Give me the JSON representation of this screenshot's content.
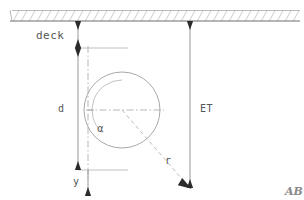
{
  "figure": {
    "background_color": "#ffffff",
    "line_color": "#9a9a9a",
    "dim_line_color": "#8c8c8c",
    "text_color": "#555555",
    "hatch_color": "#8f8f8f"
  },
  "labels": {
    "deck": "deck",
    "d": "d",
    "et": "ET",
    "alpha": "α",
    "r": "r",
    "y": "y",
    "corner": "AB"
  },
  "geometry": {
    "deck_band": {
      "x": 10,
      "y": 10,
      "width": 290,
      "height": 11
    },
    "circle": {
      "cx": 122,
      "cy": 110,
      "r": 38
    },
    "center_vertical_line": {
      "x": 88,
      "y1": 46,
      "y2": 180
    },
    "center_horizontal_line": {
      "x1": 86,
      "x2": 164,
      "y": 110
    },
    "d_dimension": {
      "x": 78,
      "y_top": 48,
      "y_bottom": 170
    },
    "deck_dimension": {
      "x": 78,
      "y_top": 20,
      "y_bottom": 48
    },
    "et_dimension": {
      "x": 190,
      "y_top": 20,
      "y_bottom": 188
    },
    "radius_line": {
      "x1": 122,
      "y1": 110,
      "x2": 189,
      "y2": 187
    },
    "y_axis_arrow": {
      "x": 88,
      "y1": 170,
      "y2": 196
    },
    "angle_arc": {
      "cx": 122,
      "cy": 110,
      "radius": 30,
      "start_deg": 90,
      "end_deg": 131
    }
  },
  "annotations": {
    "alpha_description": "angle between vertical centerline and radius line",
    "d_description": "vertical distance dimension",
    "et_description": "total vertical dimension from deck",
    "r_description": "radius of circle",
    "y_description": "downward axis direction"
  }
}
